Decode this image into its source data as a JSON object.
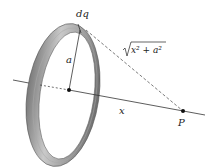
{
  "diagram": {
    "labels": {
      "charge_element": "dq",
      "radius": "a",
      "axis_distance": "x",
      "point": "P",
      "hypotenuse": "x² + a²"
    },
    "colors": {
      "ring_outer": "#8c8c8c",
      "ring_inner": "#c8c8c8",
      "line": "#333333",
      "dot": "#111111"
    }
  }
}
